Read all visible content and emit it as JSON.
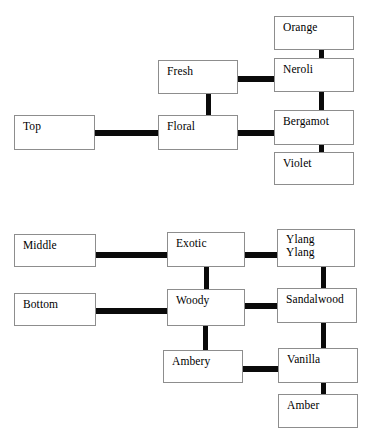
{
  "diagram": {
    "type": "tree-diagram",
    "background_color": "#ffffff",
    "box_border_color": "#8d8d8d",
    "connector_color": "#0a0a0a",
    "text_color": "#000000",
    "groups": [
      {
        "name": "top-notes-group",
        "root": "Top",
        "families": [
          "Fresh",
          "Floral"
        ],
        "ingredients": [
          "Orange",
          "Neroli",
          "Bergamot",
          "Violet"
        ]
      },
      {
        "name": "middle-bottom-notes-group",
        "roots": [
          "Middle",
          "Bottom"
        ],
        "families": [
          "Exotic",
          "Woody",
          "Ambery"
        ],
        "ingredients": [
          "Ylang Ylang",
          "Sandalwood",
          "Vanilla",
          "Amber"
        ]
      }
    ],
    "nodes": [
      {
        "id": "orange",
        "label": "Orange",
        "x": 274,
        "y": 16,
        "w": 80,
        "h": 34,
        "lines": 1
      },
      {
        "id": "neroli",
        "label": "Neroli",
        "x": 274,
        "y": 58,
        "w": 80,
        "h": 34,
        "lines": 1
      },
      {
        "id": "fresh",
        "label": "Fresh",
        "x": 158,
        "y": 60,
        "w": 80,
        "h": 34,
        "lines": 1
      },
      {
        "id": "bergamot",
        "label": "Bergamot",
        "x": 274,
        "y": 110,
        "w": 80,
        "h": 35,
        "lines": 1
      },
      {
        "id": "top",
        "label": "Top",
        "x": 14,
        "y": 115,
        "w": 81,
        "h": 35,
        "lines": 1
      },
      {
        "id": "floral",
        "label": "Floral",
        "x": 158,
        "y": 115,
        "w": 80,
        "h": 35,
        "lines": 1
      },
      {
        "id": "violet",
        "label": "Violet",
        "x": 274,
        "y": 152,
        "w": 80,
        "h": 33,
        "lines": 1
      },
      {
        "id": "middle",
        "label": "Middle",
        "x": 14,
        "y": 234,
        "w": 82,
        "h": 33,
        "lines": 1
      },
      {
        "id": "exotic",
        "label": "Exotic",
        "x": 167,
        "y": 232,
        "w": 78,
        "h": 35,
        "lines": 1
      },
      {
        "id": "ylang-ylang",
        "label": "Ylang\nYlang",
        "x": 277,
        "y": 229,
        "w": 78,
        "h": 38,
        "lines": 2
      },
      {
        "id": "bottom",
        "label": "Bottom",
        "x": 14,
        "y": 293,
        "w": 82,
        "h": 33,
        "lines": 1
      },
      {
        "id": "woody",
        "label": "Woody",
        "x": 167,
        "y": 289,
        "w": 78,
        "h": 37,
        "lines": 1
      },
      {
        "id": "sandalwood",
        "label": "Sandalwood",
        "x": 277,
        "y": 288,
        "w": 80,
        "h": 35,
        "lines": 1
      },
      {
        "id": "ambery",
        "label": "Ambery",
        "x": 163,
        "y": 350,
        "w": 80,
        "h": 33,
        "lines": 1
      },
      {
        "id": "vanilla",
        "label": "Vanilla",
        "x": 278,
        "y": 348,
        "w": 80,
        "h": 35,
        "lines": 1
      },
      {
        "id": "amber",
        "label": "Amber",
        "x": 278,
        "y": 394,
        "w": 80,
        "h": 34,
        "lines": 1
      }
    ],
    "connectors": [
      {
        "id": "orange-neroli",
        "from": "orange",
        "to": "neroli",
        "orientation": "vertical",
        "x": 319,
        "y": 48,
        "w": 5,
        "h": 12
      },
      {
        "id": "fresh-neroli",
        "from": "fresh",
        "to": "neroli",
        "orientation": "horizontal",
        "x": 235,
        "y": 76,
        "w": 42,
        "h": 6
      },
      {
        "id": "neroli-bergamot",
        "from": "neroli",
        "to": "bergamot",
        "orientation": "vertical",
        "x": 319,
        "y": 90,
        "w": 5,
        "h": 22
      },
      {
        "id": "fresh-floral",
        "from": "fresh",
        "to": "floral",
        "orientation": "vertical",
        "x": 206,
        "y": 92,
        "w": 5,
        "h": 25
      },
      {
        "id": "top-floral",
        "from": "top",
        "to": "floral",
        "orientation": "horizontal",
        "x": 93,
        "y": 130,
        "w": 67,
        "h": 6
      },
      {
        "id": "floral-bergamot",
        "from": "floral",
        "to": "bergamot",
        "orientation": "horizontal",
        "x": 236,
        "y": 130,
        "w": 41,
        "h": 6
      },
      {
        "id": "bergamot-violet",
        "from": "bergamot",
        "to": "violet",
        "orientation": "vertical",
        "x": 319,
        "y": 143,
        "w": 5,
        "h": 11
      },
      {
        "id": "middle-exotic",
        "from": "middle",
        "to": "exotic",
        "orientation": "horizontal",
        "x": 94,
        "y": 252,
        "w": 75,
        "h": 6
      },
      {
        "id": "exotic-ylang",
        "from": "exotic",
        "to": "ylang",
        "orientation": "horizontal",
        "x": 243,
        "y": 252,
        "w": 36,
        "h": 6
      },
      {
        "id": "exotic-woody",
        "from": "exotic",
        "to": "woody",
        "orientation": "vertical",
        "x": 204,
        "y": 265,
        "w": 5,
        "h": 26
      },
      {
        "id": "ylang-sandalwood",
        "from": "ylang",
        "to": "sandalwood",
        "orientation": "vertical",
        "x": 321,
        "y": 265,
        "w": 5,
        "h": 25
      },
      {
        "id": "bottom-woody",
        "from": "bottom",
        "to": "woody",
        "orientation": "horizontal",
        "x": 94,
        "y": 308,
        "w": 75,
        "h": 6
      },
      {
        "id": "woody-sandalwood",
        "from": "woody",
        "to": "sandalwood",
        "orientation": "horizontal",
        "x": 243,
        "y": 303,
        "w": 36,
        "h": 6
      },
      {
        "id": "woody-ambery",
        "from": "woody",
        "to": "ambery",
        "orientation": "vertical",
        "x": 203,
        "y": 324,
        "w": 5,
        "h": 28
      },
      {
        "id": "sandalwood-vanilla",
        "from": "sandalwood",
        "to": "vanilla",
        "orientation": "vertical",
        "x": 321,
        "y": 321,
        "w": 5,
        "h": 29
      },
      {
        "id": "ambery-vanilla",
        "from": "ambery",
        "to": "vanilla",
        "orientation": "horizontal",
        "x": 241,
        "y": 366,
        "w": 39,
        "h": 6
      },
      {
        "id": "vanilla-amber",
        "from": "vanilla",
        "to": "amber",
        "orientation": "vertical",
        "x": 321,
        "y": 381,
        "w": 5,
        "h": 15
      }
    ]
  }
}
